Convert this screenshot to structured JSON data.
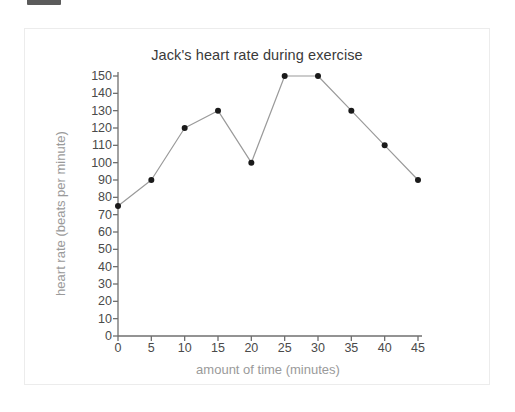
{
  "top_marker": {
    "name": "clipped-dark-bar"
  },
  "chart_data": {
    "type": "line",
    "title": "Jack's heart rate during exercise",
    "xlabel": "amount of time (minutes)",
    "ylabel": "heart rate (beats per minute)",
    "x": [
      0,
      5,
      10,
      15,
      20,
      25,
      30,
      35,
      40,
      45
    ],
    "values": [
      75,
      90,
      120,
      130,
      100,
      150,
      150,
      130,
      110,
      90
    ],
    "series": [
      {
        "name": "heart rate",
        "values": [
          75,
          90,
          120,
          130,
          100,
          150,
          150,
          130,
          110,
          90
        ]
      }
    ],
    "xlim": [
      0,
      45
    ],
    "ylim": [
      0,
      150
    ],
    "xticks": [
      0,
      5,
      10,
      15,
      20,
      25,
      30,
      35,
      40,
      45
    ],
    "yticks": [
      0,
      10,
      20,
      30,
      40,
      50,
      60,
      70,
      80,
      90,
      100,
      110,
      120,
      130,
      140,
      150
    ],
    "xtick_labels": [
      "0",
      "5",
      "10",
      "15",
      "20",
      "25",
      "30",
      "35",
      "40",
      "45"
    ],
    "ytick_labels": [
      "0",
      "10",
      "20",
      "30",
      "40",
      "50",
      "60",
      "70",
      "80",
      "90",
      "100",
      "110",
      "120",
      "130",
      "140",
      "150"
    ],
    "grid": false,
    "legend": null,
    "legend_position": "none",
    "marker": "circle",
    "colors": {
      "line": "#9a9a9a",
      "marker": "#1a1a1a",
      "axis": "#6f6f6f",
      "tick_label": "#4a4a4a",
      "axis_title": "#9a9a9a",
      "title": "#3a3a3a",
      "card_border": "#ececec",
      "background": "#ffffff"
    }
  }
}
